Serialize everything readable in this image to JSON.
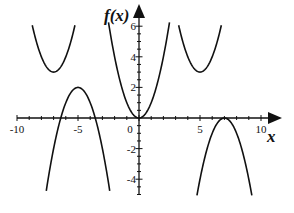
{
  "chart_data": {
    "type": "line",
    "title": "",
    "xlabel": "x",
    "ylabel": "f(x)",
    "xlim": [
      -10,
      11.5
    ],
    "ylim": [
      -5,
      6.5
    ],
    "x_ticks": [
      -10,
      -5,
      0,
      5,
      10
    ],
    "x_tick_labels": [
      "-10",
      "-5",
      "0",
      "5",
      "10"
    ],
    "y_ticks": [
      -4,
      -2,
      2,
      4,
      6
    ],
    "y_tick_labels": [
      "-4",
      "-2",
      "2",
      "4",
      "6"
    ],
    "minor_tick_step": 1,
    "grid": false,
    "legend": null,
    "line_color": "#111111",
    "series": [
      {
        "name": "central upward parabola",
        "formula": "x^2",
        "vertex": [
          0,
          0
        ],
        "x_range": [
          -2.5,
          2.5
        ]
      },
      {
        "name": "upper-left upward parabola",
        "formula": "3 + (x+7)^2",
        "vertex": [
          -7,
          3
        ],
        "x_range": [
          -8.75,
          -5.25
        ]
      },
      {
        "name": "upper-right upward parabola",
        "formula": "3 + (x-5)^2",
        "vertex": [
          5,
          3
        ],
        "x_range": [
          3.25,
          6.75
        ]
      },
      {
        "name": "lower-left downward parabola",
        "formula": "2 - (x+5)^2",
        "vertex": [
          -5,
          2
        ],
        "x_range": [
          -7.6,
          -2.4
        ]
      },
      {
        "name": "lower-right downward parabola",
        "formula": "-(x-7)^2",
        "vertex": [
          7,
          0
        ],
        "x_range": [
          4.75,
          9.25
        ]
      }
    ]
  },
  "labels": {
    "y_axis_title": "f(x)",
    "x_axis_title": "x"
  }
}
